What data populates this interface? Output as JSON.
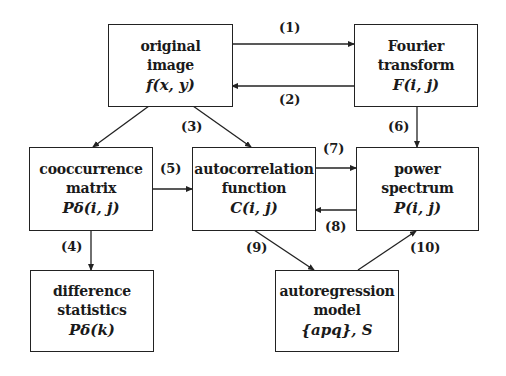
{
  "nodes": {
    "original": {
      "lines": [
        "original",
        "image"
      ],
      "math": "f(x, y)"
    },
    "fourier": {
      "lines": [
        "Fourier",
        "transform"
      ],
      "math": "F(i, j)"
    },
    "cooccurrence": {
      "lines": [
        "cooccurrence",
        "matrix"
      ],
      "math": "Pδ(i, j)"
    },
    "autocorrelation": {
      "lines": [
        "autocorrelation",
        "function"
      ],
      "math": "C(i, j)"
    },
    "power": {
      "lines": [
        "power",
        "spectrum"
      ],
      "math": "P(i, j)"
    },
    "difference": {
      "lines": [
        "difference",
        "statistics"
      ],
      "math": "Pδ(k)"
    },
    "autoregression": {
      "lines": [
        "autoregression",
        "model"
      ],
      "math": "{apq}, S"
    }
  },
  "edges": [
    {
      "id": "1",
      "label": "(1)",
      "from": "original",
      "to": "fourier"
    },
    {
      "id": "2",
      "label": "(2)",
      "from": "fourier",
      "to": "original"
    },
    {
      "id": "3",
      "label": "(3)",
      "from": "original",
      "to": "autocorrelation"
    },
    {
      "id": "3b",
      "label": "",
      "from": "original",
      "to": "cooccurrence"
    },
    {
      "id": "4",
      "label": "(4)",
      "from": "cooccurrence",
      "to": "difference"
    },
    {
      "id": "5",
      "label": "(5)",
      "from": "cooccurrence",
      "to": "autocorrelation"
    },
    {
      "id": "6",
      "label": "(6)",
      "from": "fourier",
      "to": "power"
    },
    {
      "id": "7",
      "label": "(7)",
      "from": "autocorrelation",
      "to": "power"
    },
    {
      "id": "8",
      "label": "(8)",
      "from": "power",
      "to": "autocorrelation"
    },
    {
      "id": "9",
      "label": "(9)",
      "from": "autocorrelation",
      "to": "autoregression"
    },
    {
      "id": "10",
      "label": "(10)",
      "from": "autoregression",
      "to": "power"
    }
  ]
}
